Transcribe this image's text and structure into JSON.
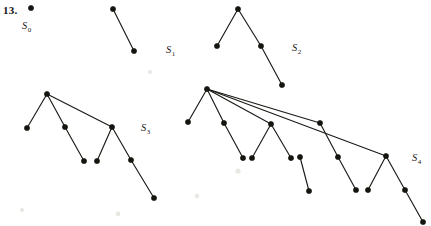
{
  "figure": {
    "exercise_number": "13.",
    "caption_present": false,
    "background_color": "#ffffff",
    "ink_color": "#15140f",
    "width": 431,
    "height": 226,
    "labels": [
      {
        "name": "label-s0",
        "base": "S",
        "sub": "0",
        "x": 22,
        "y": 29
      },
      {
        "name": "label-s1",
        "base": "S",
        "sub": "1",
        "x": 166,
        "y": 53
      },
      {
        "name": "label-s2",
        "base": "S",
        "sub": "2",
        "x": 292,
        "y": 51
      },
      {
        "name": "label-s3",
        "base": "S",
        "sub": "3",
        "x": 141,
        "y": 131
      },
      {
        "name": "label-s4",
        "base": "S",
        "sub": "4",
        "x": 412,
        "y": 161
      }
    ],
    "trees": [
      {
        "name": "tree-s0",
        "label": "S0",
        "nodes": [
          [
            31,
            8
          ]
        ],
        "edges": []
      },
      {
        "name": "tree-s1",
        "label": "S1",
        "nodes": [
          [
            113,
            9
          ],
          [
            134,
            51
          ]
        ],
        "edges": [
          [
            0,
            1
          ]
        ]
      },
      {
        "name": "tree-s2",
        "label": "S2",
        "nodes": [
          [
            238,
            9
          ],
          [
            217,
            46
          ],
          [
            261,
            46
          ],
          [
            282,
            85
          ]
        ],
        "edges": [
          [
            0,
            1
          ],
          [
            0,
            2
          ],
          [
            2,
            3
          ]
        ]
      },
      {
        "name": "tree-s3",
        "label": "S3",
        "nodes": [
          [
            47,
            94
          ],
          [
            27,
            128
          ],
          [
            65,
            127
          ],
          [
            84,
            161
          ],
          [
            97,
            161
          ],
          [
            112,
            127
          ],
          [
            131,
            160
          ],
          [
            154,
            198
          ]
        ],
        "edges": [
          [
            0,
            1
          ],
          [
            0,
            2
          ],
          [
            0,
            5
          ],
          [
            2,
            3
          ],
          [
            4,
            5
          ],
          [
            5,
            6
          ],
          [
            6,
            7
          ]
        ]
      },
      {
        "name": "tree-s4",
        "label": "S4",
        "nodes": [
          [
            207,
            89
          ],
          [
            188,
            122
          ],
          [
            224,
            123
          ],
          [
            243,
            158
          ],
          [
            252,
            158
          ],
          [
            271,
            124
          ],
          [
            291,
            158
          ],
          [
            300,
            157
          ],
          [
            309,
            191
          ],
          [
            320,
            123
          ],
          [
            338,
            157
          ],
          [
            356,
            190
          ],
          [
            368,
            190
          ],
          [
            386,
            156
          ],
          [
            405,
            190
          ],
          [
            423,
            222
          ]
        ],
        "edges": [
          [
            0,
            1
          ],
          [
            0,
            2
          ],
          [
            0,
            5
          ],
          [
            0,
            9
          ],
          [
            0,
            13
          ],
          [
            2,
            3
          ],
          [
            4,
            5
          ],
          [
            5,
            6
          ],
          [
            7,
            8
          ],
          [
            9,
            10
          ],
          [
            10,
            11
          ],
          [
            12,
            13
          ],
          [
            13,
            14
          ],
          [
            14,
            15
          ]
        ]
      }
    ]
  }
}
